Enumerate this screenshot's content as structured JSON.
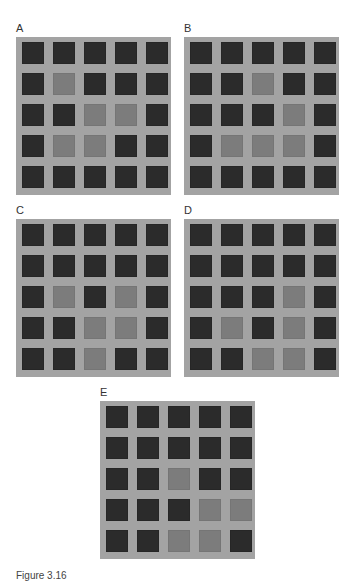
{
  "figure": {
    "caption": "Figure 3.16",
    "colors": {
      "frame": "#a3a3a3",
      "dark_cell": "#2b2b2b",
      "light_cell": "#7c7c7c"
    },
    "grid_size": 5,
    "panels": [
      {
        "label": "A",
        "x": 16,
        "y": 37,
        "label_y": 23,
        "cells": [
          [
            0,
            0,
            0,
            0,
            0
          ],
          [
            0,
            1,
            0,
            0,
            0
          ],
          [
            0,
            0,
            1,
            1,
            0
          ],
          [
            0,
            1,
            1,
            0,
            0
          ],
          [
            0,
            0,
            0,
            0,
            0
          ]
        ]
      },
      {
        "label": "B",
        "x": 184,
        "y": 37,
        "label_y": 23,
        "cells": [
          [
            0,
            0,
            0,
            0,
            0
          ],
          [
            0,
            0,
            1,
            0,
            0
          ],
          [
            0,
            0,
            0,
            1,
            0
          ],
          [
            0,
            1,
            1,
            1,
            0
          ],
          [
            0,
            0,
            0,
            0,
            0
          ]
        ]
      },
      {
        "label": "C",
        "x": 16,
        "y": 219,
        "label_y": 205,
        "cells": [
          [
            0,
            0,
            0,
            0,
            0
          ],
          [
            0,
            0,
            0,
            0,
            0
          ],
          [
            0,
            1,
            0,
            1,
            0
          ],
          [
            0,
            0,
            1,
            1,
            0
          ],
          [
            0,
            0,
            1,
            0,
            0
          ]
        ]
      },
      {
        "label": "D",
        "x": 184,
        "y": 219,
        "label_y": 205,
        "cells": [
          [
            0,
            0,
            0,
            0,
            0
          ],
          [
            0,
            0,
            0,
            0,
            0
          ],
          [
            0,
            0,
            0,
            1,
            0
          ],
          [
            0,
            1,
            0,
            1,
            0
          ],
          [
            0,
            0,
            1,
            1,
            0
          ]
        ]
      },
      {
        "label": "E",
        "x": 100,
        "y": 401,
        "label_y": 387,
        "cells": [
          [
            0,
            0,
            0,
            0,
            0
          ],
          [
            0,
            0,
            0,
            0,
            0
          ],
          [
            0,
            0,
            1,
            0,
            0
          ],
          [
            0,
            0,
            0,
            1,
            1
          ],
          [
            0,
            0,
            1,
            1,
            0
          ]
        ]
      }
    ]
  }
}
